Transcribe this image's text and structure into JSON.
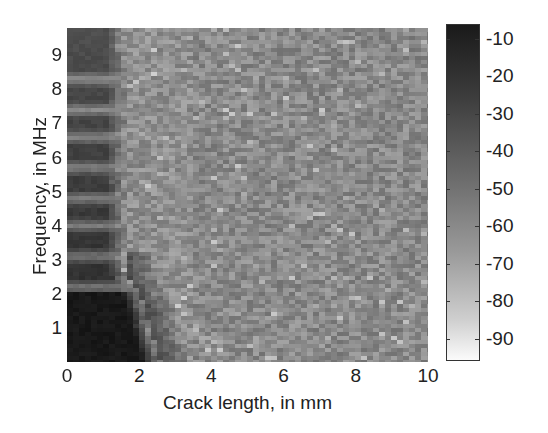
{
  "chart_data": {
    "type": "heatmap",
    "title": "",
    "xlabel": "Crack length, in mm",
    "ylabel": "Frequency, in MHz",
    "xlim": [
      0,
      10
    ],
    "ylim": [
      0,
      9.8
    ],
    "x_ticks": [
      "0",
      "2",
      "4",
      "6",
      "8",
      "10"
    ],
    "y_ticks": [
      "1",
      "2",
      "3",
      "4",
      "5",
      "6",
      "7",
      "8",
      "9"
    ],
    "colorbar": {
      "ticks": [
        "-10",
        "-20",
        "-30",
        "-40",
        "-50",
        "-60",
        "-70",
        "-80",
        "-90"
      ],
      "range": [
        -96,
        -6
      ],
      "colormap": "gray (dark = high, light = low)"
    },
    "features": {
      "dark_region_boundary_mm_at_freq": [
        [
          0.2,
          3.0
        ],
        [
          1.0,
          2.7
        ],
        [
          2.0,
          2.0
        ],
        [
          2.2,
          1.5
        ],
        [
          1.6,
          1.0
        ]
      ],
      "banded_region_max_mm": 1.6,
      "light_stripes_MHz": [
        2.2,
        3.1,
        4.0,
        4.8,
        5.7,
        6.6,
        7.4,
        8.3
      ],
      "background_level_dB": -50
    },
    "grid": false,
    "legend": "colorbar right"
  },
  "labels": {
    "x_axis": "Crack length, in mm",
    "y_axis": "Frequency, in MHz"
  }
}
